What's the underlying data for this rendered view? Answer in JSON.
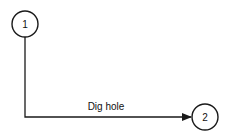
{
  "diagram": {
    "type": "activity-on-arrow network",
    "nodes": [
      {
        "id": "1",
        "label": "1",
        "cx": 25,
        "cy": 24,
        "r": 13
      },
      {
        "id": "2",
        "label": "2",
        "cx": 205,
        "cy": 117,
        "r": 13
      }
    ],
    "edges": [
      {
        "from": "1",
        "to": "2",
        "label": "Dig hole"
      }
    ],
    "colors": {
      "stroke": "#1a1a1a",
      "background": "#ffffff"
    }
  }
}
